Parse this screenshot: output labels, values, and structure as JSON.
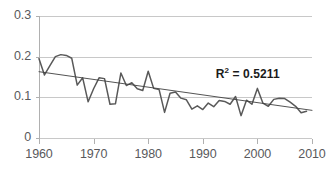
{
  "chart_data": {
    "type": "line",
    "title": "",
    "xlabel": "",
    "ylabel": "",
    "xlim": [
      1960,
      2010
    ],
    "ylim": [
      0,
      0.3
    ],
    "xticks": [
      1960,
      1970,
      1980,
      1990,
      2000,
      2010
    ],
    "yticks": [
      0,
      0.1,
      0.2,
      0.3
    ],
    "ytick_labels": [
      "0",
      "0.1",
      "0.2",
      "0.3"
    ],
    "xtick_labels": [
      "1960",
      "1970",
      "1980",
      "1990",
      "2000",
      "2010"
    ],
    "grid": "horizontal",
    "legend": "none",
    "annotations": [
      {
        "name": "r-squared",
        "text_prefix": "R",
        "text_sup": "2",
        "text_suffix": " = 0.5211",
        "full_text": "R² = 0.5211",
        "value": 0.5211,
        "x": 1997.5,
        "y": 0.155
      }
    ],
    "series": [
      {
        "name": "data-series",
        "color": "#595959",
        "kind": "line",
        "x": [
          1960,
          1961,
          1962,
          1963,
          1964,
          1965,
          1966,
          1967,
          1968,
          1969,
          1970,
          1971,
          1972,
          1973,
          1974,
          1975,
          1976,
          1977,
          1978,
          1979,
          1980,
          1981,
          1982,
          1983,
          1984,
          1985,
          1986,
          1987,
          1988,
          1989,
          1990,
          1991,
          1992,
          1993,
          1994,
          1995,
          1996,
          1997,
          1998,
          1999,
          2000,
          2001,
          2002,
          2003,
          2004,
          2005,
          2006,
          2007,
          2008,
          2009
        ],
        "values": [
          0.195,
          0.155,
          0.178,
          0.2,
          0.205,
          0.203,
          0.196,
          0.13,
          0.148,
          0.089,
          0.121,
          0.148,
          0.146,
          0.083,
          0.084,
          0.16,
          0.129,
          0.136,
          0.121,
          0.117,
          0.164,
          0.122,
          0.119,
          0.063,
          0.11,
          0.113,
          0.098,
          0.094,
          0.071,
          0.079,
          0.07,
          0.086,
          0.077,
          0.092,
          0.09,
          0.083,
          0.102,
          0.055,
          0.093,
          0.083,
          0.122,
          0.086,
          0.078,
          0.095,
          0.098,
          0.097,
          0.088,
          0.078,
          0.062,
          0.066
        ]
      },
      {
        "name": "linear-trendline",
        "color": "#3f3f3f",
        "kind": "trendline",
        "x": [
          1960,
          2010
        ],
        "values": [
          0.163,
          0.068
        ]
      }
    ]
  },
  "style": {
    "grid_color": "#c8c8c8",
    "axis_color": "#b0b0b0",
    "tick_label_color": "#59595c",
    "series_color": "#595959",
    "trendline_color": "#3f3f3f",
    "annotation_color": "#1b1b1b",
    "background": "#ffffff"
  },
  "layout": {
    "plot_left": 39,
    "plot_right": 312,
    "plot_top": 16,
    "plot_bottom": 138
  }
}
